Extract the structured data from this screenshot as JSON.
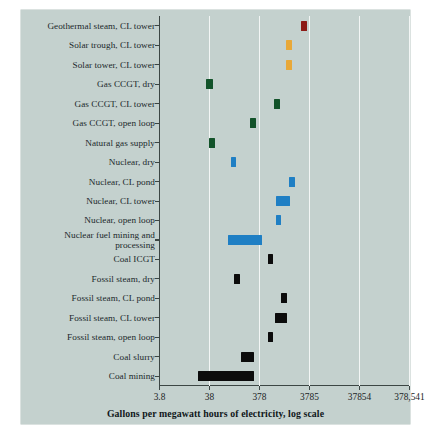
{
  "chart_data": {
    "type": "bar",
    "orientation": "horizontal",
    "title": "",
    "subtitle": "",
    "xlabel": "Gallons per megawatt hours of electricity, log scale",
    "ylabel": "",
    "scale": "log",
    "grid": true,
    "legend": null,
    "xticklabels": [
      "3.8",
      "38",
      "378",
      "3785",
      "37854",
      "378,541"
    ],
    "xtickvalues": [
      3.8,
      38,
      378,
      3785,
      37854,
      378541
    ],
    "xlim": [
      3.8,
      378541
    ],
    "categories": [
      "Geothermal steam, CL tower",
      "Solar trough, CL tower",
      "Solar tower, CL tower",
      "Gas CCGT, dry",
      "Gas CCGT, CL tower",
      "Gas CCGT, open loop",
      "Natural gas supply",
      "Nuclear, dry",
      "Nuclear, CL pond",
      "Nuclear, CL tower",
      "Nuclear, open loop",
      "Nuclear fuel mining and processing",
      "Coal ICGT",
      "Fossil steam, dry",
      "Fossil steam, CL pond",
      "Fossil steam, CL tower",
      "Fossil steam, open loop",
      "Coal slurry",
      "Coal mining"
    ],
    "ranges": [
      {
        "category": "Geothermal steam, CL tower",
        "low": 2600,
        "high": 3400,
        "color": "#8c1a16",
        "group": "geothermal"
      },
      {
        "category": "Solar trough, CL tower",
        "low": 1300,
        "high": 1700,
        "color": "#e8a838",
        "group": "solar"
      },
      {
        "category": "Solar tower, CL tower",
        "low": 1300,
        "high": 1700,
        "color": "#e8a838",
        "group": "solar"
      },
      {
        "category": "Gas CCGT, dry",
        "low": 33,
        "high": 44,
        "color": "#12532a",
        "group": "gas"
      },
      {
        "category": "Gas CCGT, CL tower",
        "low": 730,
        "high": 960,
        "color": "#12532a",
        "group": "gas"
      },
      {
        "category": "Gas CCGT, open loop",
        "low": 250,
        "high": 330,
        "color": "#12532a",
        "group": "gas"
      },
      {
        "category": "Natural gas supply",
        "low": 37,
        "high": 50,
        "color": "#12532a",
        "group": "gas"
      },
      {
        "category": "Nuclear, dry",
        "low": 100,
        "high": 130,
        "color": "#1f7fc4",
        "group": "nuclear"
      },
      {
        "category": "Nuclear, CL pond",
        "low": 1500,
        "high": 1950,
        "color": "#1f7fc4",
        "group": "nuclear"
      },
      {
        "category": "Nuclear, CL tower",
        "low": 820,
        "high": 1560,
        "color": "#1f7fc4",
        "group": "nuclear"
      },
      {
        "category": "Nuclear, open loop",
        "low": 800,
        "high": 1020,
        "color": "#1f7fc4",
        "group": "nuclear"
      },
      {
        "category": "Nuclear fuel mining and processing",
        "low": 90,
        "high": 430,
        "color": "#1f7fc4",
        "group": "nuclear"
      },
      {
        "category": "Coal ICGT",
        "low": 560,
        "high": 720,
        "color": "#0c0c0c",
        "group": "coal"
      },
      {
        "category": "Fossil steam, dry",
        "low": 120,
        "high": 155,
        "color": "#0c0c0c",
        "group": "coal"
      },
      {
        "category": "Fossil steam, CL pond",
        "low": 1030,
        "high": 1330,
        "color": "#0c0c0c",
        "group": "coal"
      },
      {
        "category": "Fossil steam, CL tower",
        "low": 790,
        "high": 1340,
        "color": "#0c0c0c",
        "group": "coal"
      },
      {
        "category": "Fossil steam, open loop",
        "low": 560,
        "high": 720,
        "color": "#0c0c0c",
        "group": "coal"
      },
      {
        "category": "Coal slurry",
        "low": 160,
        "high": 290,
        "color": "#0c0c0c",
        "group": "coal"
      },
      {
        "category": "Coal mining",
        "low": 22,
        "high": 290,
        "color": "#0c0c0c",
        "group": "coal"
      }
    ],
    "colors": {
      "geothermal": "#8c1a16",
      "solar": "#e8a838",
      "gas": "#12532a",
      "nuclear": "#1f7fc4",
      "coal": "#0c0c0c",
      "panel_background": "#c4d1ce",
      "gridline": "#f3f6f5",
      "axis": "#3c4644",
      "page_background": "#ffffff"
    }
  }
}
